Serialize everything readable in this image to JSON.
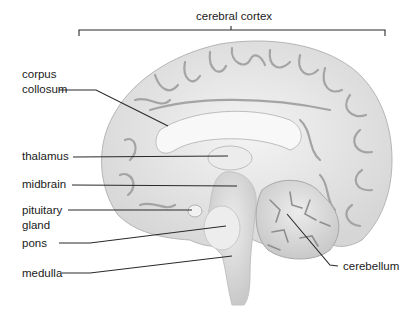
{
  "diagram": {
    "labels": {
      "cerebral_cortex": "cerebral cortex",
      "corpus_collosum_1": "corpus",
      "corpus_collosum_2": "collosum",
      "thalamus": "thalamus",
      "midbrain": "midbrain",
      "pituitary_1": "pituitary",
      "pituitary_2": "gland",
      "pons": "pons",
      "medulla": "medulla",
      "cerebellum": "cerebellum"
    },
    "colors": {
      "background": "#ffffff",
      "tissue": "#e4e4e4",
      "tissue_light": "#f2f2f2",
      "sulcus": "#a8a8a8",
      "leader_line": "#2a2a2a",
      "text": "#1a1a1a"
    }
  }
}
